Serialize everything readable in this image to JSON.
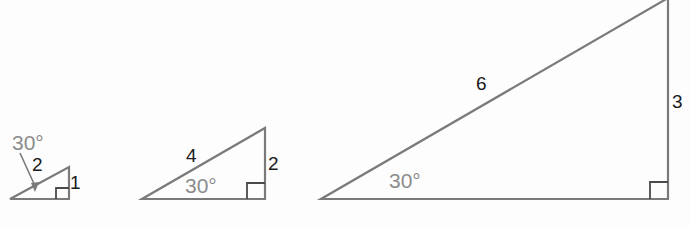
{
  "colors": {
    "stroke": "#7a7a7a",
    "side_label": "#1a1a1a",
    "angle_label": "#8c8c8c"
  },
  "triangles": [
    {
      "id": "small",
      "angle_label": "30°",
      "hypotenuse_label": "2",
      "opposite_label": "1",
      "has_right_angle_mark": true,
      "angle_label_with_pointer": true
    },
    {
      "id": "medium",
      "angle_label": "30°",
      "hypotenuse_label": "4",
      "opposite_label": "2",
      "has_right_angle_mark": true
    },
    {
      "id": "large",
      "angle_label": "30°",
      "hypotenuse_label": "6",
      "opposite_label": "3",
      "has_right_angle_mark": true
    }
  ]
}
